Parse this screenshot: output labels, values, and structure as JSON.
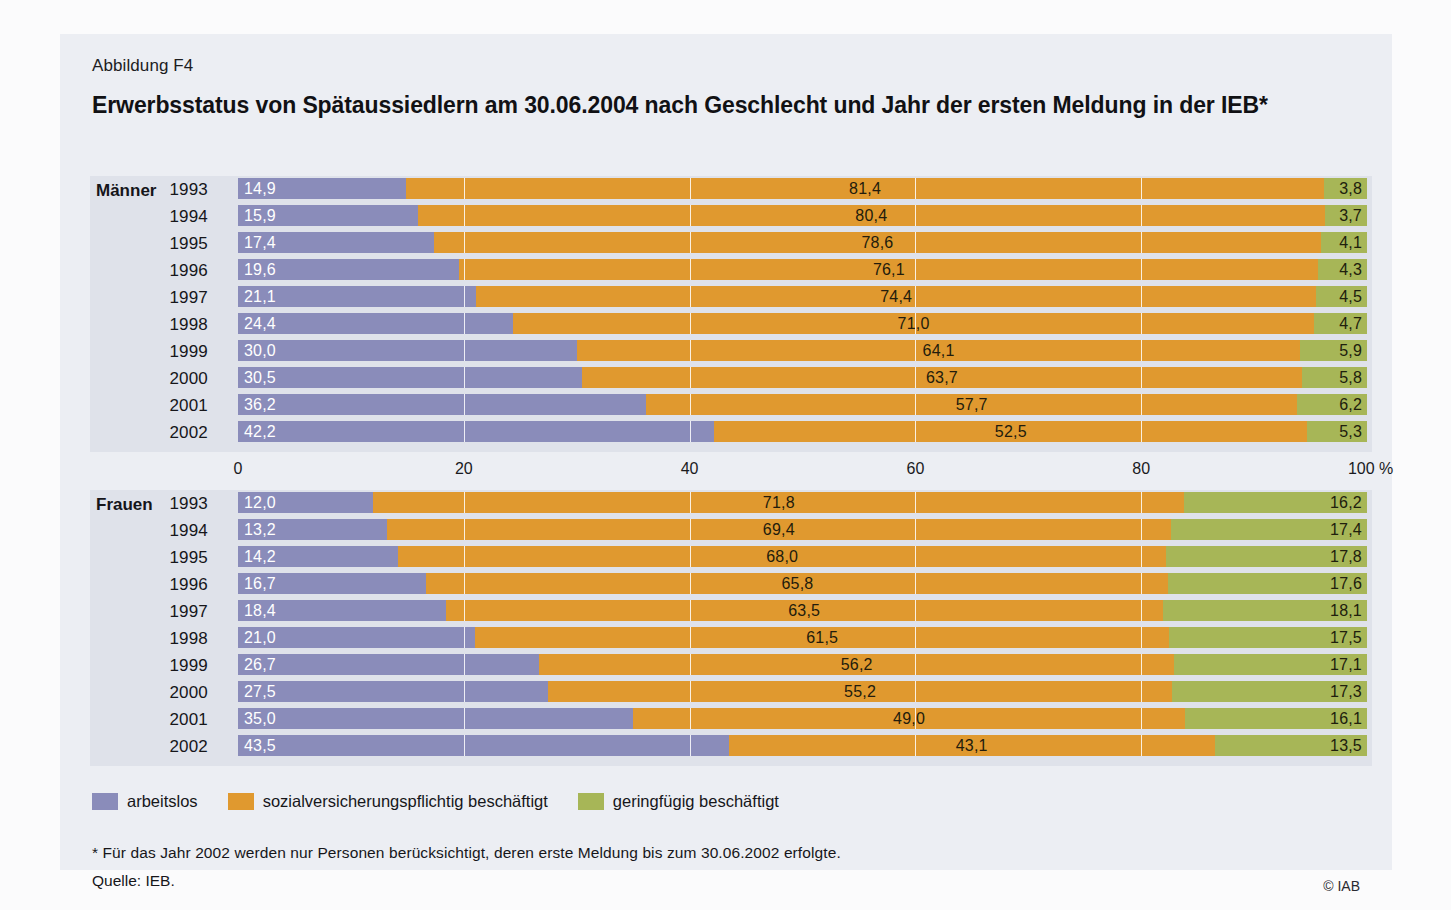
{
  "figure": {
    "label": "Abbildung F4",
    "title": "Erwerbsstatus von Spätaussiedlern am 30.06.2004 nach Geschlecht und Jahr der ersten Meldung in der IEB*",
    "footnote": "* Für das Jahr 2002 werden nur Personen berücksichtigt, deren erste Meldung bis zum 30.06.2002 erfolgte.",
    "source": "Quelle: IEB.",
    "copyright": "© IAB"
  },
  "legend": {
    "items": [
      {
        "label": "arbeitslos",
        "color": "#8a8cba"
      },
      {
        "label": "sozialversicherungspflichtig beschäftigt",
        "color": "#e0992f"
      },
      {
        "label": "geringfügig beschäftigt",
        "color": "#a7b657"
      }
    ]
  },
  "axis": {
    "ticks": [
      "0",
      "20",
      "40",
      "60",
      "80",
      "100 %"
    ],
    "tick_values": [
      0,
      20,
      40,
      60,
      80,
      100
    ],
    "unit": "%"
  },
  "colors": {
    "arbeitslos": "#8a8cba",
    "sozialversicherungspflichtig": "#e0992f",
    "geringfuegig": "#a7b657",
    "panel_bg": "#dfe2ea",
    "card_bg": "#eceef3"
  },
  "chart_data": {
    "type": "bar",
    "orientation": "horizontal",
    "stacked": true,
    "stack_total": 100,
    "title": "Erwerbsstatus von Spätaussiedlern am 30.06.2004 nach Geschlecht und Jahr der ersten Meldung in der IEB*",
    "xlabel": "%",
    "ylabel": "Jahr der ersten Meldung",
    "xlim": [
      0,
      100
    ],
    "grid": true,
    "legend_position": "bottom-left",
    "series": [
      {
        "name": "arbeitslos",
        "color": "#8a8cba"
      },
      {
        "name": "sozialversicherungspflichtig beschäftigt",
        "color": "#e0992f"
      },
      {
        "name": "geringfügig beschäftigt",
        "color": "#a7b657"
      }
    ],
    "groups": [
      {
        "name": "Männer",
        "categories": [
          "1993",
          "1994",
          "1995",
          "1996",
          "1997",
          "1998",
          "1999",
          "2000",
          "2001",
          "2002"
        ],
        "values": {
          "arbeitslos": [
            14.9,
            15.9,
            17.4,
            19.6,
            21.1,
            24.4,
            30.0,
            30.5,
            36.2,
            42.2
          ],
          "sozialversicherungspflichtig beschäftigt": [
            81.4,
            80.4,
            78.6,
            76.1,
            74.4,
            71.0,
            64.1,
            63.7,
            57.7,
            52.5
          ],
          "geringfügig beschäftigt": [
            3.8,
            3.7,
            4.1,
            4.3,
            4.5,
            4.7,
            5.9,
            5.8,
            6.2,
            5.3
          ]
        },
        "labels": {
          "arbeitslos": [
            "14,9",
            "15,9",
            "17,4",
            "19,6",
            "21,1",
            "24,4",
            "30,0",
            "30,5",
            "36,2",
            "42,2"
          ],
          "sozialversicherungspflichtig beschäftigt": [
            "81,4",
            "80,4",
            "78,6",
            "76,1",
            "74,4",
            "71,0",
            "64,1",
            "63,7",
            "57,7",
            "52,5"
          ],
          "geringfügig beschäftigt": [
            "3,8",
            "3,7",
            "4,1",
            "4,3",
            "4,5",
            "4,7",
            "5,9",
            "5,8",
            "6,2",
            "5,3"
          ]
        }
      },
      {
        "name": "Frauen",
        "categories": [
          "1993",
          "1994",
          "1995",
          "1996",
          "1997",
          "1998",
          "1999",
          "2000",
          "2001",
          "2002"
        ],
        "values": {
          "arbeitslos": [
            12.0,
            13.2,
            14.2,
            16.7,
            18.4,
            21.0,
            26.7,
            27.5,
            35.0,
            43.5
          ],
          "sozialversicherungspflichtig beschäftigt": [
            71.8,
            69.4,
            68.0,
            65.8,
            63.5,
            61.5,
            56.2,
            55.2,
            49.0,
            43.1
          ],
          "geringfügig beschäftigt": [
            16.2,
            17.4,
            17.8,
            17.6,
            18.1,
            17.5,
            17.1,
            17.3,
            16.1,
            13.5
          ]
        },
        "labels": {
          "arbeitslos": [
            "12,0",
            "13,2",
            "14,2",
            "16,7",
            "18,4",
            "21,0",
            "26,7",
            "27,5",
            "35,0",
            "43,5"
          ],
          "sozialversicherungspflichtig beschäftigt": [
            "71,8",
            "69,4",
            "68,0",
            "65,8",
            "63,5",
            "61,5",
            "56,2",
            "55,2",
            "49,0",
            "43,1"
          ],
          "geringfügig beschäftigt": [
            "16,2",
            "17,4",
            "17,8",
            "17,6",
            "18,1",
            "17,5",
            "17,1",
            "17,3",
            "16,1",
            "13,5"
          ]
        }
      }
    ]
  }
}
